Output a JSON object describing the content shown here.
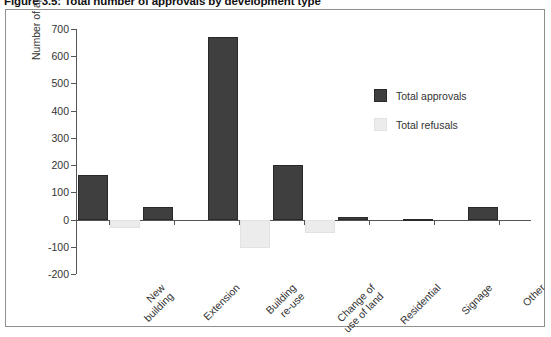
{
  "figure": {
    "caption": "Figure 3.5: Total number of approvals by development type"
  },
  "legend": {
    "position": "inside-top-right",
    "entries": [
      {
        "label": "Total approvals",
        "color": "#3f3f3f",
        "key": "approvals"
      },
      {
        "label": "Total refusals",
        "color": "#ececec",
        "key": "refusals"
      }
    ]
  },
  "chart_data": {
    "type": "bar",
    "title": "Figure 3.5: Total number of approvals by development type",
    "xlabel": "",
    "ylabel": "Number of applications",
    "ylim": [
      -200,
      700
    ],
    "yticks": [
      700,
      600,
      500,
      400,
      300,
      200,
      100,
      0,
      -100,
      -200
    ],
    "ytick_labels": [
      "700",
      "600",
      "500",
      "400",
      "300",
      "200",
      "100",
      "0",
      "-100",
      "-200"
    ],
    "grid": false,
    "legend_position": "inside-top-right",
    "categories": [
      "New building",
      "Extension",
      "Building re-use",
      "Change of use of land",
      "Residential",
      "Signage",
      "Other"
    ],
    "category_lines": [
      [
        "New",
        "building"
      ],
      [
        "Extension"
      ],
      [
        "Building",
        "re-use"
      ],
      [
        "Change of",
        "use of land"
      ],
      [
        "Residential"
      ],
      [
        "Signage"
      ],
      [
        "Other"
      ]
    ],
    "series": [
      {
        "name": "Total approvals",
        "color": "#3f3f3f",
        "values": [
          165,
          45,
          670,
          200,
          10,
          2,
          45
        ]
      },
      {
        "name": "Total refusals",
        "color": "#ececec",
        "values": [
          -30,
          0,
          -105,
          -50,
          0,
          0,
          0
        ]
      }
    ]
  }
}
